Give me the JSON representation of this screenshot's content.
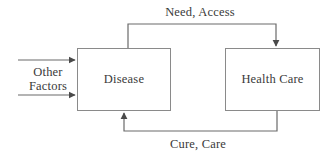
{
  "diagram": {
    "background_color": "#ffffff",
    "line_color": "#6a6a6a",
    "box_border_color": "#8a8a8a",
    "text_color": "#3a3a3a",
    "nodes": [
      {
        "id": "disease",
        "label": "Disease"
      },
      {
        "id": "health_care",
        "label": "Health Care"
      }
    ],
    "edges": [
      {
        "id": "need_access",
        "label": "Need, Access",
        "from": "disease",
        "to": "health_care",
        "position": "top"
      },
      {
        "id": "cure_care",
        "label": "Cure, Care",
        "from": "health_care",
        "to": "disease",
        "position": "bottom"
      },
      {
        "id": "other_factors_upper",
        "label": "",
        "from": "external",
        "to": "disease",
        "position": "left-upper"
      },
      {
        "id": "other_factors_lower",
        "label": "",
        "from": "external",
        "to": "disease",
        "position": "left-lower"
      }
    ],
    "external_input": {
      "label_line1": "Other",
      "label_line2": "Factors"
    }
  }
}
